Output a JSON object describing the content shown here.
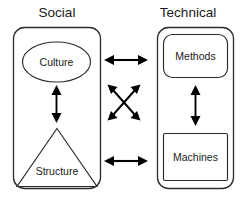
{
  "diagram": {
    "panels": [
      {
        "id": "social",
        "title": "Social",
        "shape": "rounded-rectangle",
        "nodes": [
          {
            "id": "culture",
            "label": "Culture",
            "shape": "ellipse"
          },
          {
            "id": "structure",
            "label": "Structure",
            "shape": "triangle"
          }
        ]
      },
      {
        "id": "technical",
        "title": "Technical",
        "shape": "rounded-rectangle",
        "nodes": [
          {
            "id": "methods",
            "label": "Methods",
            "shape": "rounded-rectangle"
          },
          {
            "id": "machines",
            "label": "Machines",
            "shape": "rectangle"
          }
        ]
      }
    ],
    "connectors": [
      {
        "id": "culture-methods",
        "style": "double-arrow",
        "orientation": "horizontal"
      },
      {
        "id": "structure-machines",
        "style": "double-arrow",
        "orientation": "horizontal"
      },
      {
        "id": "culture-structure",
        "style": "double-arrow",
        "orientation": "vertical"
      },
      {
        "id": "methods-machines",
        "style": "double-arrow",
        "orientation": "vertical"
      },
      {
        "id": "culture-machines",
        "style": "double-arrow",
        "orientation": "diagonal-down"
      },
      {
        "id": "structure-methods",
        "style": "double-arrow",
        "orientation": "diagonal-up"
      }
    ],
    "colors": {
      "stroke": "#2b2b2b",
      "arrow": "#000000",
      "text": "#1a1a1a",
      "background": "#ffffff"
    }
  }
}
